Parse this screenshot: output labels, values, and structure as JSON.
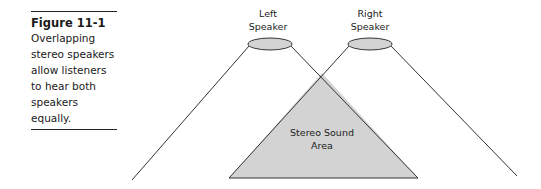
{
  "caption": {
    "figure_label": "Figure 11-1",
    "lines": [
      "Overlapping",
      "stereo speakers",
      "allow listeners",
      "to hear both",
      "speakers equally."
    ]
  },
  "diagram": {
    "left_speaker": {
      "label_line1": "Left",
      "label_line2": "Speaker"
    },
    "right_speaker": {
      "label_line1": "Right",
      "label_line2": "Speaker"
    },
    "overlap_area": {
      "label_line1": "Stereo Sound",
      "label_line2": "Area"
    },
    "colors": {
      "fill": "#d3d3d3",
      "stroke": "#333333"
    }
  }
}
